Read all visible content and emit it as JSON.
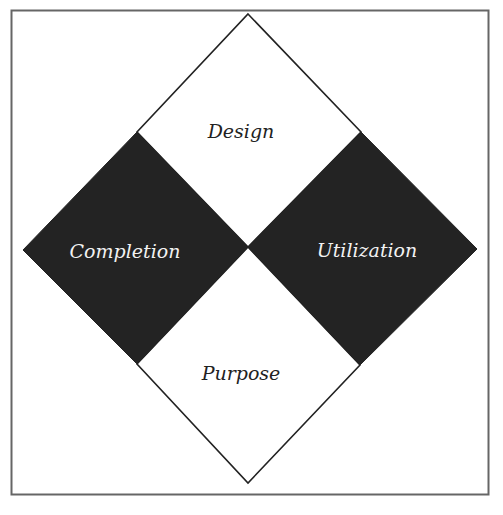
{
  "diagram": {
    "type": "quadrant-diamond",
    "frame": {
      "x": 11,
      "y": 10,
      "width": 478,
      "height": 485,
      "stroke": "#666666"
    },
    "colors": {
      "dark_fill": "#232323",
      "light_fill": "#ffffff",
      "outline": "#222222",
      "dark_text": "#f2f2f2",
      "light_text": "#222222"
    },
    "quadrants": [
      {
        "id": "top",
        "label": "Design",
        "fill": "light"
      },
      {
        "id": "left",
        "label": "Completion",
        "fill": "dark"
      },
      {
        "id": "right",
        "label": "Utilization",
        "fill": "dark"
      },
      {
        "id": "bottom",
        "label": "Purpose",
        "fill": "light"
      }
    ]
  }
}
